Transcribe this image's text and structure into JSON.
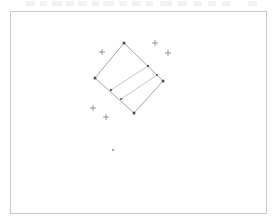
{
  "app": {
    "title": "Geometry Canvas",
    "background_color": "#ffffff"
  },
  "toolbar_strip": {
    "name": "cropped-toolbar",
    "visible": true,
    "marks": [
      {
        "x": 26,
        "w": 9
      },
      {
        "x": 40,
        "w": 7
      },
      {
        "x": 52,
        "w": 10
      },
      {
        "x": 66,
        "w": 8
      },
      {
        "x": 78,
        "w": 9
      },
      {
        "x": 92,
        "w": 7
      },
      {
        "x": 103,
        "w": 11
      },
      {
        "x": 119,
        "w": 8
      },
      {
        "x": 132,
        "w": 9
      },
      {
        "x": 146,
        "w": 7
      },
      {
        "x": 160,
        "w": 12
      },
      {
        "x": 178,
        "w": 9
      },
      {
        "x": 194,
        "w": 8
      },
      {
        "x": 208,
        "w": 8
      },
      {
        "x": 222,
        "w": 8
      },
      {
        "x": 248,
        "w": 9
      }
    ]
  },
  "canvas": {
    "name": "drawing-canvas",
    "frame": {
      "x": 10,
      "y": 11,
      "width": 257,
      "height": 203
    },
    "border_color": "#c9c9cc",
    "fill_color": "#ffffff"
  },
  "chart_data": {
    "type": "scatter",
    "title": "",
    "subtitle": "",
    "xlabel": "",
    "ylabel": "",
    "grid": false,
    "legend": null,
    "xlim": [
      10,
      267
    ],
    "ylim": [
      11,
      214
    ],
    "annotations": [
      "rotated square with two interior parallel chords",
      "scattered plus markers outside the square",
      "one small stray point below the square"
    ],
    "shapes": [
      {
        "name": "rotated-square",
        "kind": "polygon",
        "closed": true,
        "stroke": "#7e7e86",
        "fill": "none",
        "points": [
          {
            "label": "top",
            "x": 124,
            "y": 43
          },
          {
            "label": "right",
            "x": 163,
            "y": 81
          },
          {
            "label": "bottom",
            "x": 134,
            "y": 113
          },
          {
            "label": "left",
            "x": 95,
            "y": 78
          }
        ]
      },
      {
        "name": "interior-chord-a",
        "kind": "line",
        "stroke": "#9d9da5",
        "points": [
          {
            "x": 111,
            "y": 90
          },
          {
            "x": 148,
            "y": 66
          }
        ]
      },
      {
        "name": "interior-chord-b",
        "kind": "line",
        "stroke": "#9d9da5",
        "points": [
          {
            "x": 121,
            "y": 99
          },
          {
            "x": 157,
            "y": 75
          }
        ]
      }
    ],
    "vertex_handles": [
      {
        "x": 124,
        "y": 43,
        "r": 1.5
      },
      {
        "x": 163,
        "y": 81,
        "r": 1.5
      },
      {
        "x": 134,
        "y": 113,
        "r": 1.5
      },
      {
        "x": 95,
        "y": 78,
        "r": 1.5
      }
    ],
    "edge_nodes": [
      {
        "x": 148,
        "y": 66,
        "r": 1.2
      },
      {
        "x": 111,
        "y": 90,
        "r": 1.2
      },
      {
        "x": 157,
        "y": 75,
        "r": 1.1
      },
      {
        "x": 121,
        "y": 99,
        "r": 1.1
      }
    ],
    "cross_markers": [
      {
        "x": 102,
        "y": 52,
        "size": 3
      },
      {
        "x": 155,
        "y": 43,
        "size": 3
      },
      {
        "x": 168,
        "y": 53,
        "size": 3
      },
      {
        "x": 93,
        "y": 108,
        "size": 3
      },
      {
        "x": 106,
        "y": 117,
        "size": 3
      }
    ],
    "points": [
      {
        "x": 113,
        "y": 150,
        "r": 1.1,
        "label": "stray-point"
      }
    ]
  }
}
